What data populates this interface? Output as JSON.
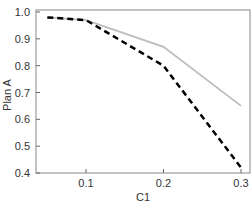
{
  "chart_data": {
    "type": "line",
    "title": "",
    "xlabel": "C1",
    "ylabel": "Plan A",
    "xlim": [
      0.04,
      0.31
    ],
    "ylim": [
      0.4,
      1.0
    ],
    "xticks": [
      0.1,
      0.2,
      0.3
    ],
    "xtick_labels": [
      "0.1",
      "0.2",
      "0.3"
    ],
    "yticks": [
      0.4,
      0.5,
      0.6,
      0.7,
      0.8,
      0.9,
      1.0
    ],
    "ytick_labels": [
      "0.4",
      "0.5",
      "0.6",
      "0.7",
      "0.8",
      "0.9",
      "1.0"
    ],
    "grid": false,
    "legend": null,
    "series": [
      {
        "name": "solid-gray",
        "style": "solid",
        "color": "#bdbdbd",
        "x": [
          0.05,
          0.1,
          0.2,
          0.3
        ],
        "values": [
          0.98,
          0.97,
          0.87,
          0.65
        ]
      },
      {
        "name": "dashed-black",
        "style": "dashed",
        "color": "#000000",
        "x": [
          0.05,
          0.1,
          0.2,
          0.3
        ],
        "values": [
          0.98,
          0.97,
          0.8,
          0.42
        ]
      }
    ]
  }
}
